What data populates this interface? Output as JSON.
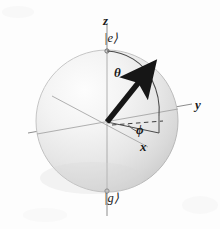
{
  "figure": {
    "type": "bloch-sphere-diagram"
  },
  "axes": {
    "z": {
      "label": "z",
      "orientation": "vertical"
    },
    "y": {
      "label": "y",
      "orientation": "right"
    },
    "x": {
      "label": "x",
      "orientation": "lower-right"
    }
  },
  "angles": {
    "theta": {
      "label": "θ",
      "description": "polar angle from z axis"
    },
    "phi": {
      "label": "ϕ",
      "description": "azimuthal angle in xy plane"
    }
  },
  "states": {
    "excited": {
      "label": "|e⟩",
      "position": "north-pole"
    },
    "ground": {
      "label": "|g⟩",
      "position": "south-pole"
    }
  },
  "colors": {
    "background": "#fdfdfd",
    "sphere_light": "#fbfbfb",
    "sphere_mid": "#eeeeee",
    "sphere_dark": "#d2d2d2",
    "sphere_edge": "#b8b8b8",
    "axis_line": "#8d8d8d",
    "vector": "#161616",
    "arc": "#4a4a4a",
    "text": "#1a1a1a"
  },
  "geometry": {
    "center_x": 107,
    "center_y": 121,
    "radius": 71,
    "vector_tip_x": 147,
    "vector_tip_y": 71
  }
}
